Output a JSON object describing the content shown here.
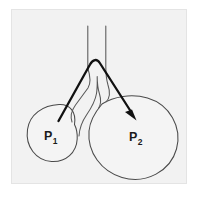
{
  "figure": {
    "background_color": "#ffffff",
    "panel_color": "#f2f2f2",
    "panel_border_color": "#e4e4e4",
    "outline_color": "#4a4a4a",
    "arrow_color": "#111111",
    "label_color": "#1a1a1a"
  },
  "labels": {
    "left_alveolus": {
      "base": "P",
      "subscript": "1",
      "full": "P1"
    },
    "right_alveolus": {
      "base": "P",
      "subscript": "2",
      "full": "P2"
    }
  },
  "elements": {
    "small_alveolus_name": "small alveolus",
    "large_alveolus_name": "large alveolus",
    "airway_name": "bifurcating airway",
    "flow_arrow_name": "gas flow arrow",
    "flow_direction": "P1 to P2"
  },
  "geometry": {
    "small_alveolus": {
      "cx": 51,
      "cy": 134,
      "r": 28
    },
    "large_alveolus": {
      "cx": 133,
      "cy": 136,
      "r": 45
    },
    "trunk": {
      "left_x": 88,
      "right_x": 106,
      "top_y": 26
    },
    "bifurcation_y": 62,
    "arrow_start": {
      "x": 59,
      "y": 120
    },
    "arrow_apex": {
      "x": 96,
      "y": 59
    },
    "arrow_end": {
      "x": 135,
      "y": 116
    }
  }
}
